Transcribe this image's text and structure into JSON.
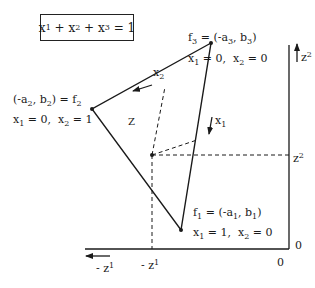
{
  "constraint_box": {
    "x1": "x",
    "s1": "1",
    "plus1": " + ",
    "x2": "x",
    "s2": "2",
    "plus2": " + ",
    "x3": "x",
    "s3": "3",
    "eq": " = 1"
  },
  "vertices": {
    "f3": {
      "label_a": "f",
      "label_sub": "3",
      "label_rest_1": " = (-a",
      "a_sub": "3",
      "label_rest_2": ", b",
      "b_sub": "3",
      "label_rest_3": ")",
      "cond_x1": "x",
      "cond_x1_sub": "1",
      "cond_x1_val": " = 0,  ",
      "cond_x2": "x",
      "cond_x2_sub": "2",
      "cond_x2_val": " = 0"
    },
    "f2": {
      "label_pre": "(-a",
      "a_sub": "2",
      "label_mid": ", b",
      "b_sub": "2",
      "label_post": ") = f",
      "f_sub": "2",
      "cond_x1": "x",
      "cond_x1_sub": "1",
      "cond_x1_val": " = 0,  ",
      "cond_x2": "x",
      "cond_x2_sub": "2",
      "cond_x2_val": " = 1"
    },
    "f1": {
      "label_a": "f",
      "label_sub": "1",
      "label_rest_1": " = (-a",
      "a_sub": "1",
      "label_rest_2": ", b",
      "b_sub": "1",
      "label_rest_3": ")",
      "cond_x1": "x",
      "cond_x1_sub": "1",
      "cond_x1_val": " = 1,  ",
      "cond_x2": "x",
      "cond_x2_sub": "2",
      "cond_x2_val": " = 0"
    }
  },
  "direction_labels": {
    "x2": {
      "base": "x",
      "sub": "2"
    },
    "x1": {
      "base": "x",
      "sub": "1"
    }
  },
  "region_label": "Z",
  "axes": {
    "z2_axis": {
      "base": "z",
      "sup": "2"
    },
    "z2_tick": {
      "base": "z",
      "sup": "2"
    },
    "neg_z1_axis": {
      "base": "- z",
      "sup": "1"
    },
    "neg_z1_tick": {
      "base": "- z",
      "sup": "1"
    },
    "origin_right": "0",
    "origin_bottom": "0"
  },
  "geometry": {
    "f3": [
      211,
      43
    ],
    "f2": [
      92,
      109
    ],
    "f1": [
      181,
      230
    ],
    "interior_point": [
      152,
      155
    ],
    "axis_corner": [
      289,
      249
    ]
  }
}
